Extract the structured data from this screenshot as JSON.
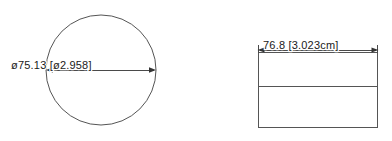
{
  "drawing": {
    "background_color": "#ffffff",
    "line_color": "#555555",
    "dimension_color": "#4a4a4a",
    "text_color": "#1a1a1a",
    "views": [
      {
        "name": "front-view-circle",
        "shape": "circle",
        "dimension": {
          "label": "ø75.13  [ø2.958]",
          "value_mm": "75.13",
          "value_alt": "2.958",
          "symbol": "ø",
          "orientation": "horizontal",
          "placement": "center-diameter"
        }
      },
      {
        "name": "side-view-rectangle",
        "shape": "rectangle-with-divider",
        "dimension": {
          "label": "76.8  [3.023cm]",
          "value_mm": "76.8",
          "value_alt": "3.023cm",
          "orientation": "horizontal",
          "placement": "above"
        }
      }
    ]
  }
}
